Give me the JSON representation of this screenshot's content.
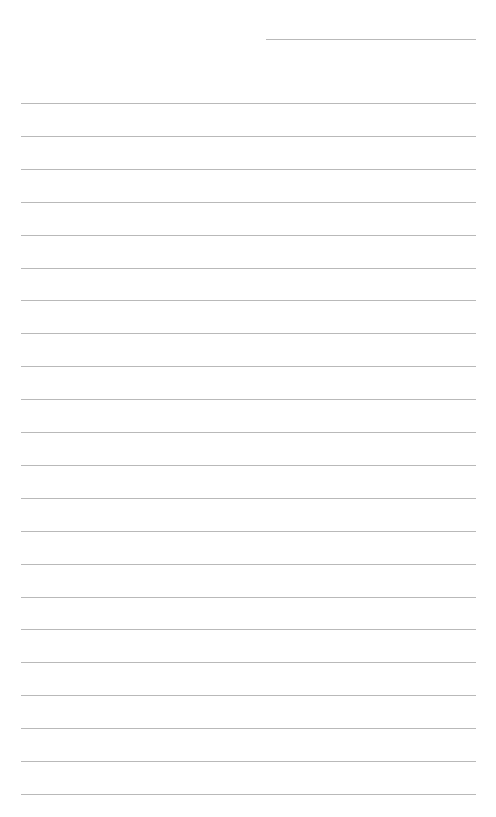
{
  "page": {
    "type": "lined-paper",
    "background": "#ffffff",
    "rule_color": "#b9b9b9",
    "header_line": {
      "x": 266,
      "y": 39,
      "width": 210
    },
    "rules": {
      "count": 22,
      "x": 21,
      "width": 455,
      "first_y": 103,
      "last_y": 794
    }
  }
}
